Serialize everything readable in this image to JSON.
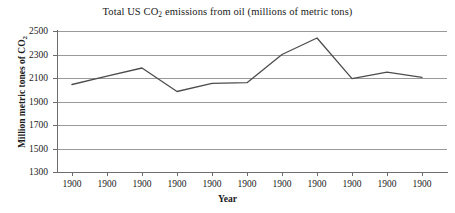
{
  "chart_data": {
    "type": "line",
    "title": "Total US CO2 emissions from oil (millions of metric tons)",
    "title_main": "Total US CO",
    "title_sub": "2",
    "title_rest": " emissions from oil (millions of metric tons)",
    "xlabel": "Year",
    "ylabel": "Million metric tones of CO2",
    "ylabel_main": "Million metric tones of CO",
    "ylabel_sub": "2",
    "categories": [
      "1900",
      "1900",
      "1900",
      "1900",
      "1900",
      "1900",
      "1900",
      "1900",
      "1900",
      "1900",
      "1900"
    ],
    "values": [
      2045,
      2115,
      2185,
      1985,
      2055,
      2060,
      2300,
      2440,
      2095,
      2150,
      2105
    ],
    "series": [
      {
        "name": "Total US CO2 emissions from oil",
        "values": [
          2045,
          2115,
          2185,
          1985,
          2055,
          2060,
          2300,
          2440,
          2095,
          2150,
          2105
        ]
      }
    ],
    "ylim": [
      1300,
      2500
    ],
    "ytick_step": 200,
    "ytick_labels": [
      "2500",
      "2300",
      "2100",
      "1900",
      "1700",
      "1500",
      "1300"
    ],
    "ytick_values": [
      2500,
      2300,
      2100,
      1900,
      1700,
      1500,
      1300
    ],
    "xtick_labels": [
      "1900",
      "1900",
      "1900",
      "1900",
      "1900",
      "1900",
      "1900",
      "1900",
      "1900",
      "1900",
      "1900"
    ],
    "grid": true,
    "grid_axis": "y",
    "legend": false,
    "legend_position": "none",
    "line_color": "#4d4d4d",
    "grid_color": "#9a9a9a",
    "axis_color": "#6d6d6d",
    "background_color": "#ffffff",
    "text_color": "#1a1a1a"
  }
}
